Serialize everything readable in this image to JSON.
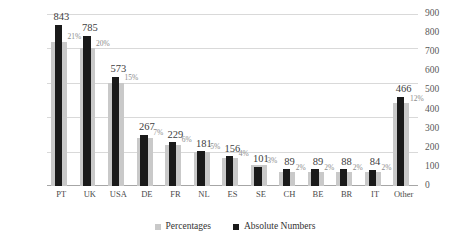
{
  "chart_data": {
    "type": "bar",
    "title": "",
    "subtitle": "",
    "xlabel": "",
    "ylabel": "",
    "grid": true,
    "legend_position": "bottom",
    "categories": [
      "PT",
      "UK",
      "USA",
      "DE",
      "FR",
      "NL",
      "ES",
      "SE",
      "CH",
      "BE",
      "BR",
      "IT",
      "Other"
    ],
    "series": [
      {
        "name": "Percentages",
        "axis": "left",
        "color": "#c9c9c9",
        "unit": "%",
        "values": [
          21,
          20,
          15,
          7,
          6,
          5,
          4,
          3,
          2,
          2,
          2,
          2,
          12
        ],
        "data_labels": [
          "21%",
          "20%",
          "15%",
          "7%",
          "6%",
          "5%",
          "4%",
          "3%",
          "2%",
          "2%",
          "2%",
          "2%",
          "12%"
        ]
      },
      {
        "name": "Absolute Numbers",
        "axis": "right",
        "color": "#1a1a1a",
        "unit": "",
        "values": [
          843,
          785,
          573,
          267,
          229,
          181,
          156,
          101,
          89,
          89,
          88,
          84,
          466
        ],
        "data_labels": [
          "843",
          "785",
          "573",
          "267",
          "229",
          "181",
          "156",
          "101",
          "89",
          "89",
          "88",
          "84",
          "466"
        ]
      }
    ],
    "left_axis": {
      "label": "",
      "min": 0,
      "max": 25,
      "step": 5,
      "ticks": [
        "0%",
        "5%",
        "10%",
        "15%",
        "20%",
        "25%"
      ],
      "tick_values": [
        0,
        5,
        10,
        15,
        20,
        25
      ]
    },
    "right_axis": {
      "label": "",
      "min": 0,
      "max": 900,
      "step": 100,
      "ticks": [
        "0",
        "100",
        "200",
        "300",
        "400",
        "500",
        "600",
        "700",
        "800",
        "900"
      ],
      "tick_values": [
        0,
        100,
        200,
        300,
        400,
        500,
        600,
        700,
        800,
        900
      ]
    }
  },
  "legend": {
    "items": [
      {
        "label": "Percentages",
        "color": "#c9c9c9"
      },
      {
        "label": "Absolute Numbers",
        "color": "#1a1a1a"
      }
    ]
  }
}
